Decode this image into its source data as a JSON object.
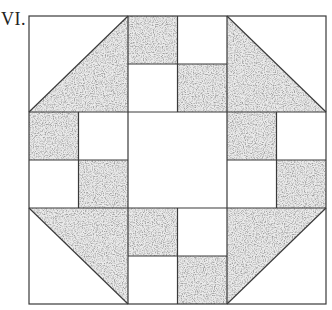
{
  "figure": {
    "label": "VI.",
    "grid": {
      "cols": 6,
      "rows": 6
    },
    "colors": {
      "line": "#3a3a3a",
      "background": "#ffffff",
      "fabric_base": "#e6e6e6",
      "fabric_speckle": "#6f6f6f"
    },
    "pieces": [
      {
        "type": "half-square-triangle",
        "position": "top-left",
        "cells": "r0-r1,c0-c1",
        "shaded": "lower-right"
      },
      {
        "type": "square",
        "position": "r0c2",
        "shaded": true
      },
      {
        "type": "square",
        "position": "r0c3",
        "shaded": false
      },
      {
        "type": "square",
        "position": "r1c2",
        "shaded": false
      },
      {
        "type": "square",
        "position": "r1c3",
        "shaded": true
      },
      {
        "type": "half-square-triangle",
        "position": "top-right",
        "cells": "r0-r1,c4-c5",
        "shaded": "lower-left"
      },
      {
        "type": "square",
        "position": "r2c0",
        "shaded": true
      },
      {
        "type": "square",
        "position": "r2c1",
        "shaded": false
      },
      {
        "type": "square",
        "position": "r3c0",
        "shaded": false
      },
      {
        "type": "square",
        "position": "r3c1",
        "shaded": true
      },
      {
        "type": "center-square",
        "position": "center",
        "cells": "r2-r3,c2-c3",
        "shaded": false
      },
      {
        "type": "square",
        "position": "r2c4",
        "shaded": true
      },
      {
        "type": "square",
        "position": "r2c5",
        "shaded": false
      },
      {
        "type": "square",
        "position": "r3c4",
        "shaded": false
      },
      {
        "type": "square",
        "position": "r3c5",
        "shaded": true
      },
      {
        "type": "half-square-triangle",
        "position": "bottom-left",
        "cells": "r4-r5,c0-c1",
        "shaded": "upper-right"
      },
      {
        "type": "square",
        "position": "r4c2",
        "shaded": true
      },
      {
        "type": "square",
        "position": "r4c3",
        "shaded": false
      },
      {
        "type": "square",
        "position": "r5c2",
        "shaded": false
      },
      {
        "type": "square",
        "position": "r5c3",
        "shaded": true
      },
      {
        "type": "half-square-triangle",
        "position": "bottom-right",
        "cells": "r4-r5,c4-c5",
        "shaded": "upper-left"
      }
    ]
  }
}
